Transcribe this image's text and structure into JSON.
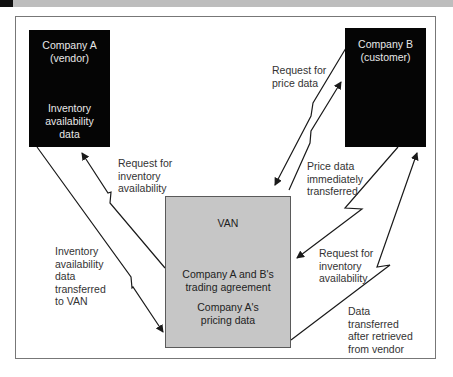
{
  "nodes": {
    "company_a": {
      "title": "Company A",
      "subtitle": "(vendor)",
      "content": [
        "Inventory",
        "availability",
        "data"
      ]
    },
    "company_b": {
      "title": "Company B",
      "subtitle": "(customer)"
    },
    "van": {
      "title": "VAN",
      "content1": [
        "Company A and B's",
        "trading agreement"
      ],
      "content2": [
        "Company A's",
        "pricing data"
      ]
    }
  },
  "edges": {
    "request_price": [
      "Request for",
      "price data"
    ],
    "price_transferred": [
      "Price data",
      "immediately",
      "transferred"
    ],
    "request_inventory_left": [
      "Request for",
      "inventory",
      "availability"
    ],
    "inventory_to_van": [
      "Inventory",
      "availability",
      "data",
      "transferred",
      "to VAN"
    ],
    "request_inventory_right": [
      "Request for",
      "inventory",
      "availability"
    ],
    "data_after_vendor": [
      "Data",
      "transferred",
      "after retrieved",
      "from vendor"
    ]
  },
  "colors": {
    "company_box": "#050505",
    "van_box": "#c6c6c6",
    "arrow": "#1a1a1a",
    "frame": "#777777"
  }
}
